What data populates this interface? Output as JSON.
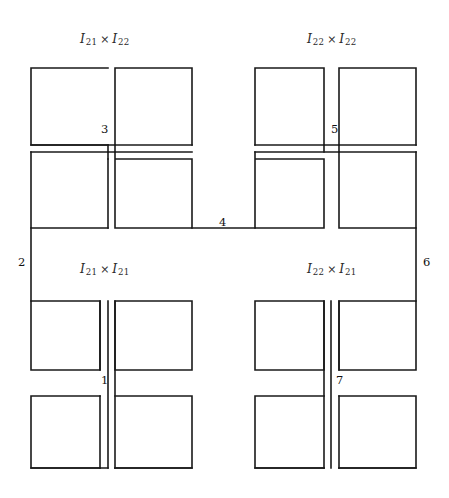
{
  "figure": {
    "type": "diagram",
    "background_color": "#ffffff",
    "line_color": "#1a1a1a",
    "quadrant_labels": [
      {
        "id": "top-left",
        "base": "I",
        "left_sub": "21",
        "operator": "×",
        "right_sub": "22",
        "x": 80,
        "y": 31
      },
      {
        "id": "top-right",
        "base": "I",
        "left_sub": "22",
        "operator": "×",
        "right_sub": "22",
        "x": 307,
        "y": 31
      },
      {
        "id": "bottom-left",
        "base": "I",
        "left_sub": "21",
        "operator": "×",
        "right_sub": "21",
        "x": 80,
        "y": 261
      },
      {
        "id": "bottom-right",
        "base": "I",
        "left_sub": "22",
        "operator": "×",
        "right_sub": "21",
        "x": 307,
        "y": 261
      }
    ],
    "node_labels": [
      {
        "id": "node-1",
        "text": "1",
        "x": 101,
        "y": 375
      },
      {
        "id": "node-2",
        "text": "2",
        "x": 18,
        "y": 257
      },
      {
        "id": "node-3",
        "text": "3",
        "x": 101,
        "y": 124
      },
      {
        "id": "node-4",
        "text": "4",
        "x": 219,
        "y": 217
      },
      {
        "id": "node-5",
        "text": "5",
        "x": 331,
        "y": 124
      },
      {
        "id": "node-6",
        "text": "6",
        "x": 423,
        "y": 257
      },
      {
        "id": "node-7",
        "text": "7",
        "x": 336,
        "y": 375
      }
    ],
    "squares": [
      {
        "id": "tl-a",
        "x": 31,
        "y": 68,
        "w": 69,
        "h": 69
      },
      {
        "id": "tl-b",
        "x": 115,
        "y": 68,
        "w": 77,
        "h": 69
      },
      {
        "id": "tl-c",
        "x": 31,
        "y": 152,
        "w": 69,
        "h": 76
      },
      {
        "id": "tl-d",
        "x": 115,
        "y": 159,
        "w": 77,
        "h": 69
      },
      {
        "id": "tr-a",
        "x": 255,
        "y": 68,
        "w": 69,
        "h": 69
      },
      {
        "id": "tr-b",
        "x": 347,
        "y": 68,
        "w": 69,
        "h": 69
      },
      {
        "id": "tr-c",
        "x": 255,
        "y": 159,
        "w": 69,
        "h": 69
      },
      {
        "id": "tr-d",
        "x": 347,
        "y": 152,
        "w": 69,
        "h": 76
      },
      {
        "id": "bl-a",
        "x": 31,
        "y": 301,
        "w": 69,
        "h": 69
      },
      {
        "id": "bl-b",
        "x": 115,
        "y": 301,
        "w": 77,
        "h": 69
      },
      {
        "id": "bl-c",
        "x": 31,
        "y": 396,
        "w": 69,
        "h": 72
      },
      {
        "id": "bl-d",
        "x": 115,
        "y": 396,
        "w": 77,
        "h": 72
      },
      {
        "id": "br-a",
        "x": 255,
        "y": 301,
        "w": 69,
        "h": 69
      },
      {
        "id": "br-b",
        "x": 347,
        "y": 301,
        "w": 69,
        "h": 69
      },
      {
        "id": "br-c",
        "x": 255,
        "y": 396,
        "w": 69,
        "h": 72
      },
      {
        "id": "br-d",
        "x": 347,
        "y": 396,
        "w": 69,
        "h": 72
      }
    ],
    "connectors": [
      {
        "id": "tl-cross-h",
        "d": "M 31 145 L 192 145"
      },
      {
        "id": "tl-cross-h2",
        "d": "M 31 152 L 192 152"
      },
      {
        "id": "tl-stem",
        "d": "M 108 137 L 108 152"
      },
      {
        "id": "tr-cross-h",
        "d": "M 255 145 L 416 145"
      },
      {
        "id": "tr-cross-h2",
        "d": "M 255 152 L 416 152"
      },
      {
        "id": "tr-stem",
        "d": "M 339 137 L 339 152"
      },
      {
        "id": "mid-h",
        "d": "M 192 228 L 255 228"
      },
      {
        "id": "left-outer",
        "d": "M 31 228 L 31 301"
      },
      {
        "id": "right-outer",
        "d": "M 416 228 L 416 301"
      },
      {
        "id": "bl-stem",
        "d": "M 108 370 L 108 396"
      },
      {
        "id": "bl-stem2",
        "d": "M 115 370 L 115 396"
      },
      {
        "id": "br-stem",
        "d": "M 324 370 L 324 396"
      },
      {
        "id": "br-stem2",
        "d": "M 331 370 L 331 396"
      }
    ]
  }
}
